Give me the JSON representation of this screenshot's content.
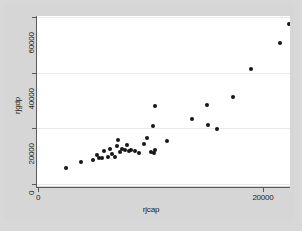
{
  "chart_data": {
    "type": "scatter",
    "title": "",
    "xlabel": "rjcap",
    "ylabel": "rjgdp",
    "xlim": [
      0,
      23000
    ],
    "ylim": [
      0,
      63000
    ],
    "xticks": [
      0,
      20000
    ],
    "xticklabels": [
      "0",
      "20000"
    ],
    "yticks": [
      0,
      20000,
      40000,
      60000
    ],
    "yticklabels": [
      "0",
      "20000",
      "40000",
      "60000"
    ],
    "grid": "horizontal",
    "legend": "none",
    "marker": "filled-circle",
    "marker_color": "#161616",
    "plot_background": "#ffffff",
    "figure_background": "#d6d6d6",
    "series": [
      {
        "name": "observations",
        "points": [
          {
            "x": 2500,
            "y": 5700
          },
          {
            "x": 3800,
            "y": 8000
          },
          {
            "x": 4900,
            "y": 8700
          },
          {
            "x": 5200,
            "y": 10400
          },
          {
            "x": 5400,
            "y": 9400
          },
          {
            "x": 5700,
            "y": 9300
          },
          {
            "x": 5900,
            "y": 11900
          },
          {
            "x": 6200,
            "y": 9600
          },
          {
            "x": 6400,
            "y": 12500
          },
          {
            "x": 6600,
            "y": 10600
          },
          {
            "x": 6800,
            "y": 9700
          },
          {
            "x": 7000,
            "y": 13700
          },
          {
            "x": 7100,
            "y": 15800
          },
          {
            "x": 7300,
            "y": 11600
          },
          {
            "x": 7500,
            "y": 12400
          },
          {
            "x": 7700,
            "y": 12200
          },
          {
            "x": 7900,
            "y": 14000
          },
          {
            "x": 8100,
            "y": 11800
          },
          {
            "x": 8300,
            "y": 12300
          },
          {
            "x": 8600,
            "y": 12000
          },
          {
            "x": 9000,
            "y": 11300
          },
          {
            "x": 9400,
            "y": 14400
          },
          {
            "x": 9700,
            "y": 16500
          },
          {
            "x": 10000,
            "y": 11600
          },
          {
            "x": 10300,
            "y": 11000
          },
          {
            "x": 10400,
            "y": 12100
          },
          {
            "x": 10200,
            "y": 20800
          },
          {
            "x": 10400,
            "y": 28000
          },
          {
            "x": 11500,
            "y": 15400
          },
          {
            "x": 13700,
            "y": 23500
          },
          {
            "x": 15000,
            "y": 28300
          },
          {
            "x": 15100,
            "y": 21300
          },
          {
            "x": 15900,
            "y": 19900
          },
          {
            "x": 17300,
            "y": 31400
          },
          {
            "x": 18900,
            "y": 41200
          },
          {
            "x": 21500,
            "y": 50600
          },
          {
            "x": 22300,
            "y": 57600
          }
        ]
      }
    ]
  },
  "axes": {
    "y_title": "rjgdp",
    "x_title": "rjcap",
    "y_tick_labels": [
      "60000",
      "40000",
      "20000",
      "0"
    ],
    "x_tick_labels": [
      "0",
      "20000"
    ]
  }
}
